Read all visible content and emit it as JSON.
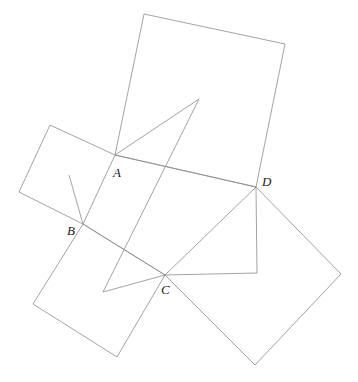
{
  "figure": {
    "type": "geometry-diagram",
    "canvas": {
      "width": 358,
      "height": 382
    },
    "background_color": "#ffffff",
    "stroke_color": "#8c8c8c",
    "stroke_width": 0.8,
    "label_color": "#1a1a1a"
  },
  "points": {
    "A": {
      "label": "A",
      "x": 115,
      "y": 155,
      "label_x": 113,
      "label_y": 166
    },
    "B": {
      "label": "B",
      "x": 83,
      "y": 224,
      "label_x": 67,
      "label_y": 224
    },
    "C": {
      "label": "C",
      "x": 165,
      "y": 275,
      "label_x": 161,
      "label_y": 283
    },
    "D": {
      "label": "D",
      "x": 256,
      "y": 187,
      "label_x": 262,
      "label_y": 175
    }
  },
  "squares": [
    {
      "name": "square-top",
      "vertices": [
        [
          115,
          155
        ],
        [
          144,
          14
        ],
        [
          285,
          44
        ],
        [
          256,
          187
        ]
      ]
    },
    {
      "name": "square-left",
      "vertices": [
        [
          115,
          155
        ],
        [
          50,
          125
        ],
        [
          19,
          192
        ],
        [
          83,
          224
        ]
      ]
    },
    {
      "name": "square-bottom-left",
      "vertices": [
        [
          83,
          224
        ],
        [
          165,
          275
        ],
        [
          117,
          357
        ],
        [
          33,
          304
        ]
      ]
    },
    {
      "name": "square-right",
      "vertices": [
        [
          256,
          187
        ],
        [
          341,
          274
        ],
        [
          255,
          365
        ],
        [
          165,
          275
        ]
      ]
    }
  ],
  "triangles": [
    {
      "name": "triangle-a-apex",
      "vertices": [
        [
          115,
          155
        ],
        [
          199,
          99
        ],
        [
          103,
          292
        ]
      ]
    },
    {
      "name": "triangle-b-wedge",
      "vertices": [
        [
          69,
          175
        ],
        [
          83,
          224
        ],
        [
          165,
          275
        ]
      ]
    },
    {
      "name": "triangle-d-wedge",
      "vertices": [
        [
          256,
          187
        ],
        [
          257,
          273
        ],
        [
          165,
          275
        ]
      ]
    },
    {
      "name": "segment-a-d",
      "vertices": [
        [
          115,
          155
        ],
        [
          256,
          187
        ]
      ]
    },
    {
      "name": "segment-c-base",
      "vertices": [
        [
          103,
          292
        ],
        [
          165,
          275
        ]
      ]
    }
  ]
}
